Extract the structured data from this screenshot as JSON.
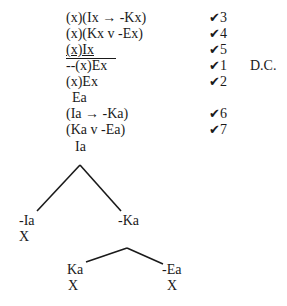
{
  "proof": {
    "lines": [
      {
        "text": "(x)(Ix → -Kx)",
        "check": "3"
      },
      {
        "text": "(x)(Kx v -Ex)",
        "check": "4"
      },
      {
        "text": "(x)Ix",
        "check": "5",
        "underlined": true
      },
      {
        "text": "--(x)Ex",
        "check": "1",
        "note": "D.C."
      },
      {
        "text": "(x)Ex",
        "check": "2"
      },
      {
        "text": "Ea",
        "check": ""
      },
      {
        "text": "(Ia → -Ka)",
        "check": "6"
      },
      {
        "text": "(Ka v -Ea)",
        "check": "7"
      }
    ],
    "check_mark": "✔",
    "tree": {
      "root": "Ia",
      "left": {
        "label": "-Ia",
        "closed": "X"
      },
      "right": {
        "label": "-Ka",
        "left": {
          "label": "Ka",
          "closed": "X"
        },
        "right": {
          "label": "-Ea",
          "closed": "X"
        }
      }
    }
  }
}
